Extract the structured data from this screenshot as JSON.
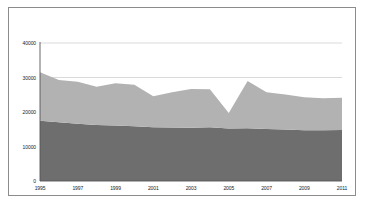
{
  "chart_data": {
    "type": "area",
    "stacked": true,
    "title": "",
    "xlabel": "",
    "ylabel": "",
    "x": [
      1995,
      1996,
      1997,
      1998,
      1999,
      2000,
      2001,
      2002,
      2003,
      2004,
      2005,
      2006,
      2007,
      2008,
      2009,
      2010,
      2011
    ],
    "series": [
      {
        "name": "series-lower",
        "color": "#6e6e6e",
        "values": [
          17500,
          17000,
          16600,
          16200,
          16100,
          15900,
          15600,
          15500,
          15400,
          15600,
          15200,
          15300,
          15100,
          14900,
          14700,
          14700,
          14800
        ]
      },
      {
        "name": "series-upper",
        "color": "#b2b2b2",
        "values": [
          14000,
          12300,
          12200,
          11100,
          12200,
          12000,
          9000,
          10200,
          11300,
          11000,
          4500,
          13700,
          10600,
          10200,
          9600,
          9300,
          9300
        ]
      }
    ],
    "totals": [
      31500,
      29300,
      28800,
      27300,
      28300,
      27900,
      24600,
      25700,
      26700,
      26600,
      19700,
      29000,
      25700,
      25100,
      24300,
      24000,
      24100
    ],
    "xlim": [
      1995,
      2011
    ],
    "ylim": [
      0,
      40000
    ],
    "yticks": [
      0,
      10000,
      20000,
      30000,
      40000
    ],
    "ytick_labels": [
      "0",
      "10000",
      "20000",
      "30000",
      "40000"
    ],
    "xticks": [
      1995,
      1997,
      1999,
      2001,
      2003,
      2005,
      2007,
      2009,
      2011
    ],
    "xtick_labels": [
      "1995",
      "1997",
      "1999",
      "2001",
      "2003",
      "2005",
      "2007",
      "2009",
      "2011"
    ],
    "gridlines": {
      "visible": true,
      "color": "#d0d0d0",
      "at": [
        30000,
        40000
      ]
    },
    "axis_color": "#555555",
    "legend": {
      "visible": false,
      "position": "none"
    },
    "frame_color": "#8c8c8c",
    "background": "#ffffff"
  }
}
